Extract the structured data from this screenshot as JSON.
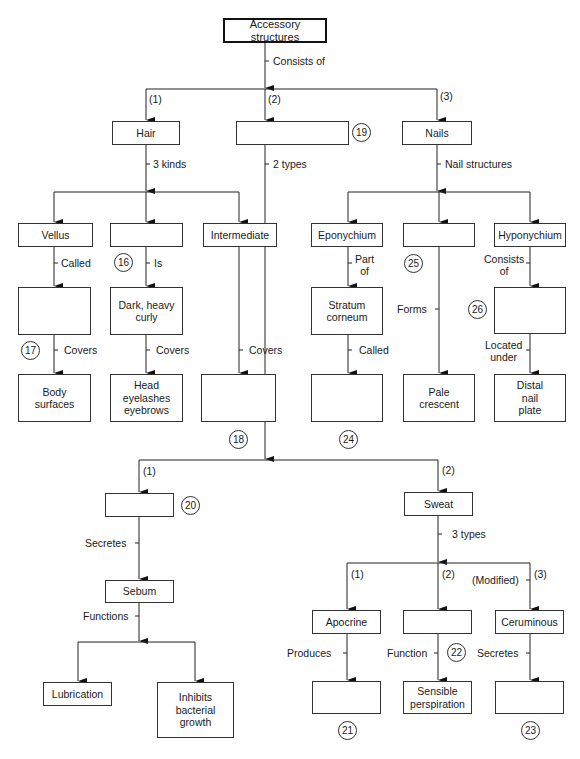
{
  "title": "Accessory structures",
  "root": {
    "label": "Accessory structures",
    "link": "Consists of"
  },
  "branches": {
    "hair": {
      "order": "(1)",
      "label": "Hair",
      "link": "3 kinds",
      "kinds": [
        {
          "label": "Vellus",
          "link": "Called",
          "child": "",
          "child_number": "17",
          "child_link": "Covers",
          "leaf": "Body\nsurfaces"
        },
        {
          "label": "",
          "number": "16",
          "link": "Is",
          "child": "Dark, heavy\ncurly",
          "child_link": "Covers",
          "leaf": "Head\neyelashes\neyebrows"
        },
        {
          "label": "Intermediate",
          "link": "Covers",
          "leaf": "",
          "leaf_number": "18"
        }
      ]
    },
    "glands": {
      "order": "(2)",
      "label": "",
      "number": "19",
      "link": "2 types",
      "types": [
        {
          "order": "(1)",
          "label": "",
          "number": "20",
          "link": "Secretes",
          "child": "Sebum",
          "child_link": "Functions",
          "functions": [
            "Lubrication",
            "Inhibits\nbacterial\ngrowth"
          ]
        },
        {
          "order": "(2)",
          "label": "Sweat",
          "link": "3 types",
          "subtypes": [
            {
              "order": "(1)",
              "label": "Apocrine",
              "link": "Produces",
              "leaf": "",
              "leaf_number": "21"
            },
            {
              "order": "(2)",
              "label": "",
              "link": "Function",
              "number": "22",
              "leaf": "Sensible\nperspiration"
            },
            {
              "order": "(3)",
              "prefix": "(Modified)",
              "label": "Ceruminous",
              "link": "Secretes",
              "leaf": "",
              "leaf_number": "23"
            }
          ]
        }
      ]
    },
    "nails": {
      "order": "(3)",
      "label": "Nails",
      "link": "Nail structures",
      "structures": [
        {
          "label": "Eponychium",
          "link": "Part\nof",
          "child": "Stratum\ncorneum",
          "child_link": "Called",
          "leaf": "",
          "leaf_number": "24"
        },
        {
          "label": "",
          "number": "25",
          "link": "Forms",
          "leaf": "Pale\ncrescent"
        },
        {
          "label": "Hyponychium",
          "link": "Consists\nof",
          "child": "",
          "child_number": "26",
          "child_link": "Located\nunder",
          "leaf": "Distal\nnail\nplate"
        }
      ]
    }
  }
}
